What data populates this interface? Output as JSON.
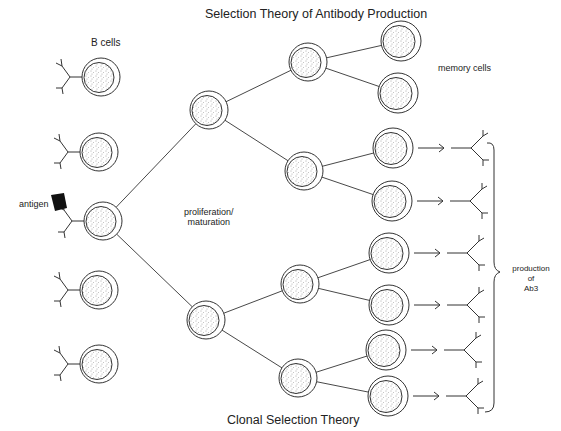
{
  "diagram": {
    "title_top": "Selection Theory of Antibody Production",
    "title_bottom": "Clonal Selection Theory",
    "labels": {
      "b_cells": "B cells",
      "antigen": "antigen",
      "proliferation_line1": "proliferation/",
      "proliferation_line2": "maturation",
      "memory_cells": "memory cells",
      "production_line1": "production",
      "production_line2": "of",
      "production_line3": "Ab3"
    },
    "colors": {
      "line": "#333333",
      "stipple": "#555555",
      "antigen_fill": "#111111",
      "background": "#ffffff"
    },
    "b_cells": [
      {
        "id": "b1",
        "x": 101,
        "y": 77,
        "receptor": "branched"
      },
      {
        "id": "b2",
        "x": 99,
        "y": 152,
        "receptor": "curly"
      },
      {
        "id": "b3",
        "x": 103,
        "y": 221,
        "receptor": "simple",
        "selected": true
      },
      {
        "id": "b4",
        "x": 99,
        "y": 290,
        "receptor": "hooked"
      },
      {
        "id": "b5",
        "x": 99,
        "y": 364,
        "receptor": "curly"
      }
    ],
    "level1": [
      {
        "id": "l1a",
        "x": 209,
        "y": 110
      },
      {
        "id": "l1b",
        "x": 206,
        "y": 320
      }
    ],
    "level2": [
      {
        "id": "l2a",
        "x": 308,
        "y": 62
      },
      {
        "id": "l2b",
        "x": 304,
        "y": 171
      },
      {
        "id": "l2c",
        "x": 300,
        "y": 284
      },
      {
        "id": "l2d",
        "x": 298,
        "y": 378
      }
    ],
    "level3": [
      {
        "id": "m1",
        "x": 401,
        "y": 41,
        "type": "memory"
      },
      {
        "id": "m2",
        "x": 398,
        "y": 93,
        "type": "memory"
      },
      {
        "id": "p1",
        "x": 393,
        "y": 148,
        "type": "plasma"
      },
      {
        "id": "p2",
        "x": 392,
        "y": 201,
        "type": "plasma"
      },
      {
        "id": "p3",
        "x": 389,
        "y": 253,
        "type": "plasma"
      },
      {
        "id": "p4",
        "x": 389,
        "y": 305,
        "type": "plasma"
      },
      {
        "id": "p5",
        "x": 386,
        "y": 350,
        "type": "plasma"
      },
      {
        "id": "p6",
        "x": 388,
        "y": 396,
        "type": "plasma"
      }
    ],
    "edges": [
      [
        "b3",
        "l1a"
      ],
      [
        "b3",
        "l1b"
      ],
      [
        "l1a",
        "l2a"
      ],
      [
        "l1a",
        "l2b"
      ],
      [
        "l1b",
        "l2c"
      ],
      [
        "l1b",
        "l2d"
      ],
      [
        "l2a",
        "m1"
      ],
      [
        "l2a",
        "m2"
      ],
      [
        "l2b",
        "p1"
      ],
      [
        "l2b",
        "p2"
      ],
      [
        "l2c",
        "p3"
      ],
      [
        "l2c",
        "p4"
      ],
      [
        "l2d",
        "p5"
      ],
      [
        "l2d",
        "p6"
      ]
    ]
  }
}
